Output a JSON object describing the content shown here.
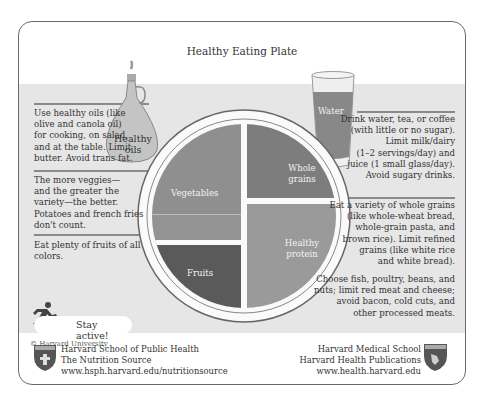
{
  "title": "Healthy Eating Plate",
  "plate": {
    "sections": [
      {
        "label_line1": "Vegetables",
        "label_line2": "",
        "color": "#8f8f8f"
      },
      {
        "label_line1": "Whole",
        "label_line2": "grains",
        "color": "#7d7d7d"
      },
      {
        "label_line1": "Healthy",
        "label_line2": "protein",
        "color": "#9a9a9a"
      },
      {
        "label_line1": "Fruits",
        "label_line2": "",
        "color": "#5a5a5a"
      }
    ]
  },
  "oils": {
    "label_line1": "Healthy",
    "label_line2": "oils"
  },
  "water": {
    "label": "Water"
  },
  "left_notes": [
    {
      "lines": [
        "Use healthy oils (like",
        "olive and canola oil)",
        "for cooking, on salad,",
        "and at the table. Limit",
        "butter. Avoid trans fat."
      ]
    },
    {
      "lines": [
        "The more veggies—",
        "and the greater the",
        "variety—the better.",
        "Potatoes and french fries",
        "don't count."
      ]
    },
    {
      "lines": [
        "Eat plenty of fruits of all",
        "colors."
      ]
    }
  ],
  "right_notes": [
    {
      "lines": [
        "Drink water, tea, or coffee",
        "(with little or no sugar).",
        "Limit milk/dairy",
        "(1–2 servings/day) and",
        "juice (1 small glass/day).",
        "Avoid sugary drinks."
      ]
    },
    {
      "lines": [
        "Eat a variety of whole grains",
        "(like whole-wheat bread,",
        "whole-grain pasta, and",
        "brown rice). Limit refined",
        "grains (like white rice",
        "and white bread)."
      ]
    },
    {
      "lines": [
        "Choose fish, poultry, beans, and",
        "nuts; limit red meat and cheese;",
        "avoid bacon, cold cuts, and",
        "other processed meats."
      ]
    }
  ],
  "stay_active": {
    "label": "Stay active!"
  },
  "copyright": "© Harvard University",
  "footer_left": {
    "lines": [
      "Harvard School of Public Health",
      "The Nutrition Source",
      "www.hsph.harvard.edu/nutritionsource"
    ]
  },
  "footer_right": {
    "lines": [
      "Harvard Medical School",
      "Harvard Health Publications",
      "www.health.harvard.edu"
    ]
  }
}
